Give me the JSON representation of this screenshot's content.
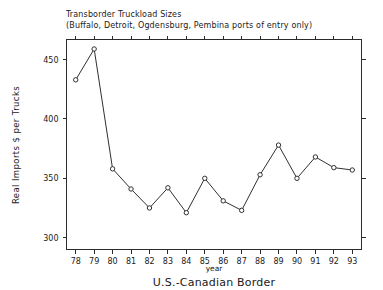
{
  "chart_data": {
    "type": "line",
    "title": "Transborder Truckload Sizes",
    "subtitle": "(Buffalo, Detroit, Ogdensburg, Pembina ports of entry only)",
    "caption": "U.S.-Canadian Border",
    "xlabel": "year",
    "ylabel": "Real Imports $ per Trucks",
    "categories": [
      "78",
      "79",
      "80",
      "81",
      "82",
      "83",
      "84",
      "85",
      "86",
      "87",
      "88",
      "89",
      "90",
      "91",
      "92",
      "93"
    ],
    "values": [
      433,
      459,
      358,
      341,
      325,
      342,
      321,
      350,
      331,
      323,
      353,
      378,
      350,
      368,
      359,
      357
    ],
    "xlim": [
      77.5,
      93.5
    ],
    "ylim": [
      290,
      467
    ],
    "yticks": [
      "300",
      "350",
      "400",
      "450"
    ],
    "ytick_values": [
      300,
      350,
      400,
      450
    ],
    "grid": false,
    "legend": null,
    "marker": "open-circle",
    "line_color": "#303030",
    "marker_fill": "#ffffff",
    "background": "#ffffff"
  }
}
